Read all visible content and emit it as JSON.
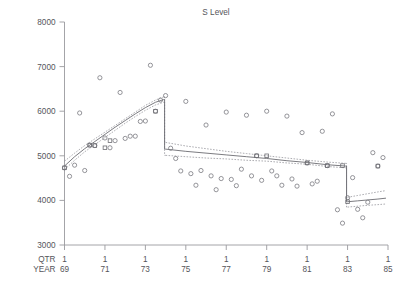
{
  "chart_data": {
    "type": "scatter",
    "title": "S Level",
    "xlabel": "",
    "ylabel": "",
    "grid": false,
    "legend_position": "none",
    "xlim": [
      69.0,
      85.0
    ],
    "ylim": [
      3000,
      8000
    ],
    "yticks": [
      3000,
      4000,
      5000,
      6000,
      7000,
      8000
    ],
    "ytick_labels": [
      "3000",
      "4000",
      "5000",
      "6000",
      "7000",
      "8000"
    ],
    "x_axis_rows": [
      {
        "header": "QTR",
        "labels": [
          "1",
          "1",
          "1",
          "1",
          "1",
          "1",
          "1",
          "1",
          "1"
        ]
      },
      {
        "header": "YEAR",
        "labels": [
          "69",
          "71",
          "73",
          "75",
          "77",
          "79",
          "81",
          "83",
          "85"
        ]
      }
    ],
    "xticks": [
      69,
      71,
      73,
      75,
      77,
      79,
      81,
      83,
      85
    ],
    "series": [
      {
        "name": "observed",
        "marker": "open-circle",
        "x": [
          69.0,
          69.25,
          69.5,
          69.75,
          70.0,
          70.25,
          70.5,
          70.75,
          71.0,
          71.25,
          71.5,
          71.75,
          72.0,
          72.25,
          72.5,
          72.75,
          73.0,
          73.25,
          73.5,
          73.75,
          74.0,
          74.25,
          74.5,
          74.75,
          75.0,
          75.25,
          75.5,
          75.75,
          76.0,
          76.25,
          76.5,
          76.75,
          77.0,
          77.25,
          77.5,
          77.75,
          78.0,
          78.25,
          78.5,
          78.75,
          79.0,
          79.25,
          79.5,
          79.75,
          80.0,
          80.25,
          80.5,
          80.75,
          81.0,
          81.25,
          81.5,
          81.75,
          82.0,
          82.25,
          82.5,
          82.75,
          83.0,
          83.25,
          83.5,
          83.75,
          84.0,
          84.25,
          84.5,
          84.75
        ],
        "y": [
          4730,
          4540,
          4790,
          5960,
          4670,
          5240,
          5230,
          6750,
          5400,
          5180,
          5340,
          6420,
          5390,
          5440,
          5440,
          5770,
          5780,
          7030,
          6000,
          6250,
          6350,
          5170,
          4940,
          4660,
          6220,
          4600,
          4340,
          4670,
          5690,
          4550,
          4240,
          4490,
          5980,
          4470,
          4330,
          4700,
          5910,
          4550,
          5000,
          4450,
          6000,
          4660,
          4550,
          4340,
          5890,
          4480,
          4320,
          5520,
          4840,
          4370,
          4430,
          5550,
          4780,
          5940,
          3790,
          3490,
          4060,
          4510,
          3800,
          3610,
          3960,
          5070,
          4770,
          4960
        ]
      },
      {
        "name": "fitted",
        "type": "line",
        "segments": [
          {
            "label": "regime-1 (1969Q1-1973Q4)",
            "x": [
              69.0,
              69.5,
              70.0,
              70.5,
              71.0,
              71.5,
              72.0,
              72.5,
              73.0,
              73.5,
              73.9
            ],
            "y": [
              4770,
              4980,
              5160,
              5320,
              5480,
              5640,
              5790,
              5940,
              6080,
              6200,
              6260
            ]
          },
          {
            "label": "regime-2 (1974Q1-1982Q4)",
            "x": [
              74.0,
              75.0,
              76.0,
              77.0,
              78.0,
              79.0,
              80.0,
              81.0,
              82.0,
              82.9
            ],
            "y": [
              5150,
              5100,
              5060,
              5020,
              4980,
              4940,
              4890,
              4850,
              4800,
              4770
            ]
          },
          {
            "label": "regime-3 (1983Q1-1984Q4)",
            "x": [
              83.0,
              83.5,
              84.0,
              84.5,
              84.9
            ],
            "y": [
              3970,
              3990,
              4010,
              4030,
              4050
            ]
          }
        ]
      },
      {
        "name": "upper-confidence-band",
        "type": "dotted-line",
        "segments": [
          {
            "x": [
              69.0,
              69.5,
              70.0,
              70.5,
              71.0,
              71.5,
              72.0,
              72.5,
              73.0,
              73.5,
              73.9
            ],
            "y": [
              4880,
              5060,
              5230,
              5380,
              5530,
              5680,
              5830,
              5980,
              6130,
              6250,
              6320
            ]
          },
          {
            "x": [
              74.0,
              75.0,
              76.0,
              77.0,
              78.0,
              79.0,
              80.0,
              81.0,
              82.0,
              82.9
            ],
            "y": [
              5300,
              5220,
              5160,
              5100,
              5050,
              5000,
              4950,
              4900,
              4860,
              4830
            ]
          },
          {
            "x": [
              83.0,
              83.5,
              84.0,
              84.5,
              84.9
            ],
            "y": [
              4070,
              4110,
              4150,
              4190,
              4220
            ]
          }
        ]
      },
      {
        "name": "lower-confidence-band",
        "type": "dotted-line",
        "segments": [
          {
            "x": [
              69.0,
              69.5,
              70.0,
              70.5,
              71.0,
              71.5,
              72.0,
              72.5,
              73.0,
              73.5,
              73.9
            ],
            "y": [
              4690,
              4900,
              5090,
              5250,
              5410,
              5570,
              5730,
              5880,
              6020,
              6140,
              6200
            ]
          },
          {
            "x": [
              74.0,
              75.0,
              76.0,
              77.0,
              78.0,
              79.0,
              80.0,
              81.0,
              82.0,
              82.9
            ],
            "y": [
              5010,
              4980,
              4950,
              4930,
              4900,
              4880,
              4840,
              4810,
              4760,
              4730
            ]
          },
          {
            "x": [
              83.0,
              83.5,
              84.0,
              84.5,
              84.9
            ],
            "y": [
              3850,
              3870,
              3890,
              3905,
              3920
            ]
          }
        ]
      },
      {
        "name": "fitted-markers",
        "marker": "open-square",
        "x": [
          69.0,
          70.25,
          70.5,
          71.0,
          71.25,
          73.5,
          78.5,
          79.0,
          81.0,
          82.0,
          82.75,
          83.0,
          84.5
        ],
        "y": [
          4730,
          5240,
          5230,
          5180,
          5340,
          6000,
          5000,
          5000,
          4840,
          4780,
          4780,
          3970,
          4770
        ]
      }
    ],
    "breaks": [
      {
        "x": 74.0,
        "label": "1974Q1"
      },
      {
        "x": 83.0,
        "label": "1983Q1"
      }
    ],
    "colors": {
      "axis": "#9a9a9e",
      "marker": "#7a7a80",
      "fit": "#6c6c72",
      "band": "#8a8a90",
      "text": "#55555a",
      "background": "#ffffff"
    }
  }
}
